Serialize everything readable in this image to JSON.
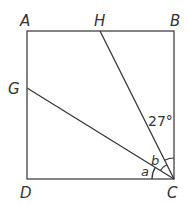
{
  "diagram": {
    "type": "geometry",
    "shape": "square",
    "points": {
      "A": {
        "label": "A",
        "x": 27,
        "y": 31
      },
      "B": {
        "label": "B",
        "x": 174,
        "y": 31
      },
      "C": {
        "label": "C",
        "x": 174,
        "y": 179
      },
      "D": {
        "label": "D",
        "x": 27,
        "y": 179
      },
      "H": {
        "label": "H",
        "x": 100,
        "y": 31
      },
      "G": {
        "label": "G",
        "x": 27,
        "y": 88
      }
    },
    "segments": [
      "AB",
      "BC",
      "CD",
      "DA",
      "HC",
      "GC"
    ],
    "angles": {
      "given": {
        "label": "27°",
        "between": "BC,HC"
      },
      "a": {
        "label": "a",
        "between": "DC,GC"
      },
      "b": {
        "label": "b",
        "between": "GC,HC"
      }
    },
    "stroke_color": "#333333"
  }
}
